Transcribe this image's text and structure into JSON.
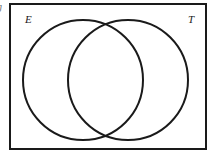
{
  "figure": {
    "kind": "venn-diagram",
    "canvas": {
      "width": 213,
      "height": 158,
      "background_color": "#ffffff"
    },
    "stroke_color": "#1a1a1a",
    "universe_rect": {
      "label": "",
      "x": 10,
      "y": 4,
      "width": 196,
      "height": 145,
      "stroke_width": 2
    },
    "circles": [
      {
        "set_label": "E",
        "cx": 83,
        "cy": 80,
        "r": 60,
        "stroke_width": 2,
        "fill": "none"
      },
      {
        "set_label": "T",
        "cx": 128,
        "cy": 80,
        "r": 60,
        "stroke_width": 2,
        "fill": "none"
      }
    ],
    "labels": {
      "left_set": "E",
      "right_set": "T",
      "clipped_edge_glyph": "g"
    }
  }
}
